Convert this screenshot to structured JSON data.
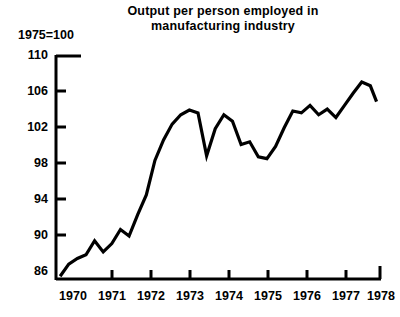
{
  "chart_data": {
    "type": "line",
    "title": "Output per person employed in manufacturing industry",
    "title_lines": [
      "Output per person employed in",
      "manufacturing industry"
    ],
    "index_note": "1975=100",
    "xlabel": "",
    "ylabel": "1975=100",
    "ylim": [
      86,
      110
    ],
    "xlim": [
      1969.5,
      1978.9
    ],
    "yticks": [
      110,
      106,
      102,
      98,
      94,
      90,
      86
    ],
    "ytick_labels": [
      "110",
      "106",
      "102",
      "98",
      "94",
      "90",
      "86"
    ],
    "xticks": [
      1970,
      1971,
      1972,
      1973,
      1974,
      1975,
      1976,
      1977,
      1978
    ],
    "xtick_labels": [
      "1970",
      "1971",
      "1972",
      "1973",
      "1974",
      "1975",
      "1976",
      "1977",
      "1978"
    ],
    "grid": false,
    "legend": "none",
    "line_color": "#000000",
    "series": [
      {
        "name": "Output per person employed",
        "x": [
          1969.62,
          1969.87,
          1970.12,
          1970.37,
          1970.62,
          1970.87,
          1971.12,
          1971.37,
          1971.62,
          1971.87,
          1972.12,
          1972.37,
          1972.62,
          1972.87,
          1973.12,
          1973.37,
          1973.62,
          1973.87,
          1974.12,
          1974.37,
          1974.62,
          1974.87,
          1975.12,
          1975.37,
          1975.62,
          1975.87,
          1976.12,
          1976.37,
          1976.62,
          1976.87,
          1977.12,
          1977.37,
          1977.62,
          1977.87,
          1978.12,
          1978.37,
          1978.62,
          1978.8
        ],
        "values": [
          86.3,
          87.6,
          88.2,
          88.6,
          90.1,
          88.9,
          89.8,
          91.3,
          90.6,
          92.9,
          95.0,
          98.7,
          100.9,
          102.6,
          103.6,
          104.1,
          103.8,
          99.2,
          102.1,
          103.6,
          102.9,
          100.4,
          100.7,
          99.1,
          98.9,
          100.2,
          102.2,
          104.0,
          103.8,
          104.6,
          103.6,
          104.2,
          103.3,
          104.6,
          105.9,
          107.1,
          106.7,
          105.0
        ]
      }
    ]
  },
  "axes": {
    "tick_marks": "outward",
    "top_cap_label": "110"
  }
}
